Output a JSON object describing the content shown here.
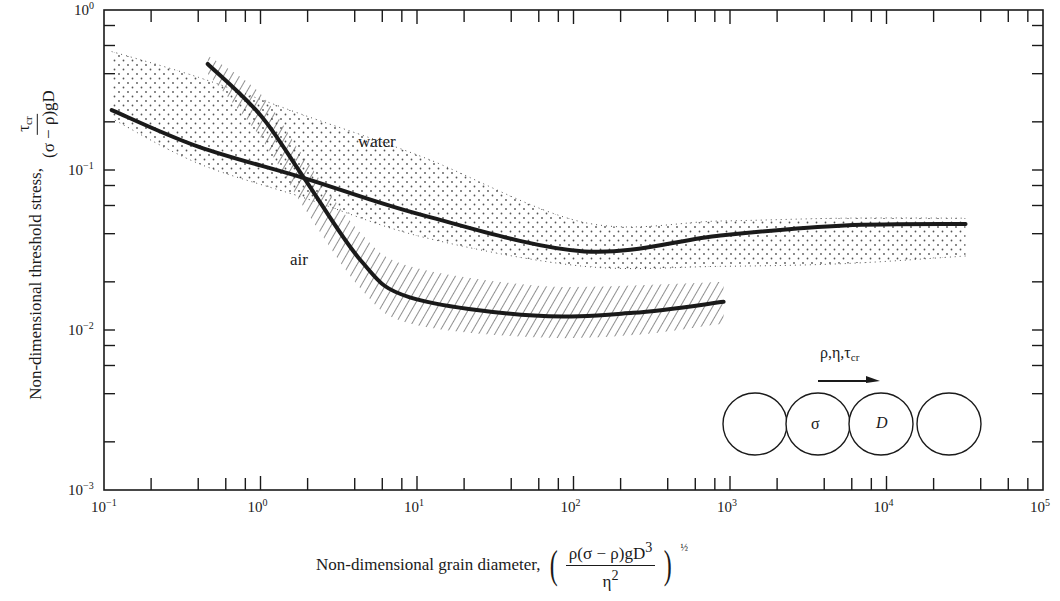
{
  "chart_data": {
    "type": "line",
    "title": "",
    "xlabel": "Non-dimensional grain diameter,",
    "xlabel_formula": "(ρ(σ−ρ)gD³ / η²)^½",
    "ylabel": "Non-dimensional threshold stress,",
    "ylabel_formula": "τcr / (σ−ρ)gD",
    "xscale": "log",
    "yscale": "log",
    "xlim": [
      0.1,
      100000
    ],
    "ylim": [
      0.001,
      1
    ],
    "x_ticks": [
      "10^-1",
      "10^0",
      "10^1",
      "10^2",
      "10^3",
      "10^4",
      "10^5"
    ],
    "y_ticks": [
      "10^-3",
      "10^-2",
      "10^-1",
      "10^0"
    ],
    "grid": false,
    "series": [
      {
        "name": "water",
        "x": [
          0.112,
          0.4,
          1.9,
          11,
          117,
          870,
          5400,
          32000
        ],
        "y": [
          0.237,
          0.14,
          0.089,
          0.052,
          0.031,
          0.039,
          0.045,
          0.046
        ],
        "band": "stippled",
        "band_upper": [
          0.55,
          0.38,
          0.22,
          0.12,
          0.047,
          0.048,
          0.05,
          0.05
        ],
        "band_lower": [
          0.21,
          0.11,
          0.067,
          0.038,
          0.025,
          0.025,
          0.026,
          0.029
        ]
      },
      {
        "name": "air",
        "x": [
          0.46,
          1.0,
          1.9,
          4.4,
          9,
          56,
          240,
          910
        ],
        "y": [
          0.46,
          0.22,
          0.089,
          0.027,
          0.016,
          0.0123,
          0.0128,
          0.015
        ],
        "band": "hatched",
        "band_upper": [
          0.52,
          0.3,
          0.12,
          0.04,
          0.025,
          0.019,
          0.019,
          0.02
        ],
        "band_lower": [
          0.4,
          0.16,
          0.058,
          0.018,
          0.011,
          0.009,
          0.0093,
          0.011
        ]
      }
    ],
    "annotations": [
      {
        "text": "water",
        "x": 9,
        "y": 0.13
      },
      {
        "text": "air",
        "x": 1.6,
        "y": 0.028
      }
    ],
    "inset": {
      "flow_label": "ρ,η,τcr",
      "grains": [
        "",
        "σ",
        "D",
        ""
      ],
      "arrow": "flow-direction"
    }
  },
  "labels": {
    "y_axis": {
      "prefix": "Non-dimensional threshold stress,",
      "num": "τ",
      "num_sub": "cr",
      "den": "(σ − ρ)gD"
    },
    "x_axis": {
      "prefix": "Non-dimensional grain diameter,",
      "num": "ρ(σ − ρ)gD",
      "num_sup": "3",
      "den": "η",
      "den_sup": "2",
      "exp": "½"
    },
    "curve_water": "water",
    "curve_air": "air",
    "inset_flow": "ρ,η,τ",
    "inset_flow_sub": "cr",
    "inset_sigma": "σ",
    "inset_D": "D"
  },
  "colors": {
    "ink": "#1a1a1a",
    "background": "#ffffff",
    "stipple": "#555555",
    "hatch": "#333333"
  }
}
